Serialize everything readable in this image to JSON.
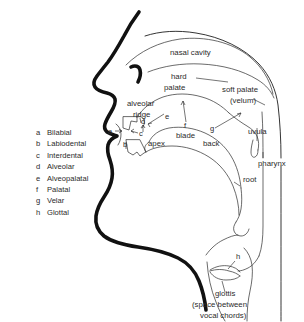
{
  "figure": {
    "background_color": "#ffffff",
    "line_color": "#111111",
    "text_color": "#2b2b2b"
  },
  "legend": {
    "items": [
      {
        "key": "a",
        "label": "Bilabial"
      },
      {
        "key": "b",
        "label": "Labiodental"
      },
      {
        "key": "c",
        "label": "Interdental"
      },
      {
        "key": "d",
        "label": "Alveolar"
      },
      {
        "key": "e",
        "label": "Alveopalatal"
      },
      {
        "key": "f",
        "label": "Palatal"
      },
      {
        "key": "g",
        "label": "Velar"
      },
      {
        "key": "h",
        "label": "Glottal"
      }
    ]
  },
  "anatomy_labels": {
    "nasal_cavity": "nasal cavity",
    "hard_palate_line1": "hard",
    "hard_palate_line2": "palate",
    "soft_palate_line1": "soft palate",
    "soft_palate_line2": "(velum)",
    "uvula": "uvula",
    "pharynx": "pharynx",
    "alveolar_ridge_line1": "alveolar",
    "alveolar_ridge_line2": "ridge",
    "apex": "apex",
    "blade": "blade",
    "back": "back",
    "root": "root",
    "glottis_line1": "glottis",
    "glottis_line2": "(space between",
    "glottis_line3": "vocal chords)"
  },
  "place_markers": {
    "a": "a",
    "b": "b",
    "c": "c",
    "d": "d",
    "e": "e",
    "f": "f",
    "g": "g",
    "h": "h"
  }
}
